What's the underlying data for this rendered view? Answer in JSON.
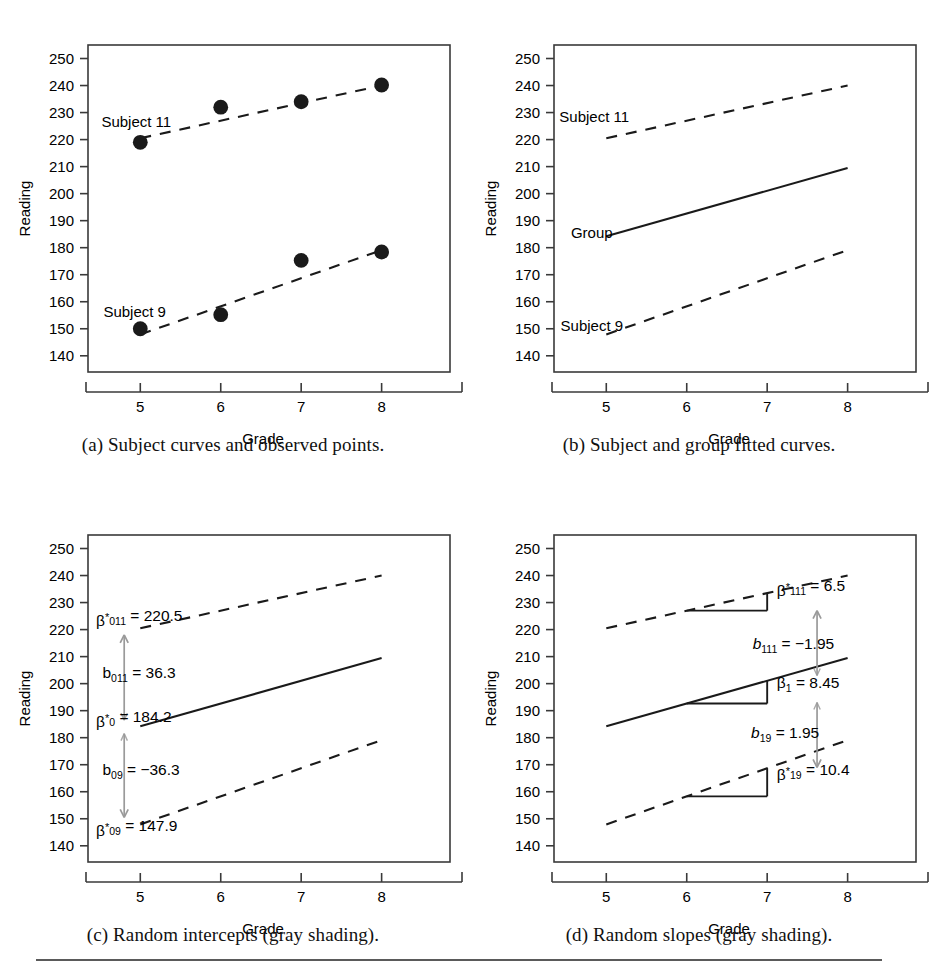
{
  "figure": {
    "axis": {
      "ylabel": "Reading",
      "xlabel": "Grade",
      "yticks": [
        140,
        150,
        160,
        170,
        180,
        190,
        200,
        210,
        220,
        230,
        240,
        250
      ],
      "xticks": [
        5,
        6,
        7,
        8
      ],
      "ylim": [
        134,
        255
      ],
      "xlim": [
        4.35,
        8.85
      ]
    },
    "footer_rule": true
  },
  "panels": [
    {
      "id": "a",
      "caption": "(a) Subject curves and observed points.",
      "labels": [
        {
          "name": "subject-11-label",
          "text": "Subject 11",
          "x": 4.95,
          "y": 224.5,
          "anchor": "middle"
        },
        {
          "name": "subject-9-label",
          "text": "Subject 9",
          "x": 4.93,
          "y": 154.5,
          "anchor": "middle"
        }
      ]
    },
    {
      "id": "b",
      "caption": "(b) Subject and group fitted curves.",
      "labels": [
        {
          "name": "subject-11-label",
          "text": "Subject 11",
          "x": 4.85,
          "y": 226.5,
          "anchor": "middle"
        },
        {
          "name": "group-label",
          "text": "Group",
          "x": 4.82,
          "y": 183.5,
          "anchor": "middle"
        },
        {
          "name": "subject-9-label",
          "text": "Subject 9",
          "x": 4.82,
          "y": 149.0,
          "anchor": "middle"
        }
      ]
    },
    {
      "id": "c",
      "caption": "(c) Random intercepts (gray shading).",
      "annotations": [
        {
          "name": "beta-star-011-annotation",
          "base": "β",
          "star": true,
          "sub": "011",
          "value": "= 220.5",
          "italic": false,
          "x": 4.45,
          "y": 221.5
        },
        {
          "name": "b-011-annotation",
          "base": "b",
          "star": false,
          "sub": "011",
          "value": "= 36.3",
          "italic": false,
          "x": 4.53,
          "y": 202.2
        },
        {
          "name": "beta-star-0-annotation",
          "base": "β",
          "star": true,
          "sub": "0",
          "value": "= 184.2",
          "italic": false,
          "x": 4.45,
          "y": 183.8
        },
        {
          "name": "b-09-annotation",
          "base": "b",
          "star": false,
          "sub": "09",
          "value": "= −36.3",
          "italic": false,
          "x": 4.53,
          "y": 166.2
        },
        {
          "name": "beta-star-09-annotation",
          "base": "β",
          "star": true,
          "sub": "09",
          "value": "= 147.9",
          "italic": false,
          "x": 4.45,
          "y": 143.8
        }
      ],
      "arrows": [
        {
          "name": "intercept-shift-up-arrow",
          "x": 4.8,
          "y0": 186.5,
          "y1": 218.0
        },
        {
          "name": "intercept-shift-down-arrow",
          "x": 4.8,
          "y0": 181.5,
          "y1": 150.5
        }
      ]
    },
    {
      "id": "d",
      "caption": "(d) Random slopes (gray shading).",
      "annotations": [
        {
          "name": "beta-star-111-annotation",
          "base": "β",
          "star": true,
          "sub": "111",
          "value": "= 6.5",
          "italic": false,
          "x": 7.12,
          "y": 232.5
        },
        {
          "name": "b-111-annotation",
          "base": "b",
          "star": false,
          "sub": "111",
          "value": "= −1.95",
          "italic": true,
          "x": 6.82,
          "y": 213.0
        },
        {
          "name": "beta-1-annotation",
          "base": "β",
          "star": false,
          "sub": "1",
          "value": "= 8.45",
          "italic": false,
          "x": 7.12,
          "y": 198.5
        },
        {
          "name": "b-19-annotation",
          "base": "b",
          "star": false,
          "sub": "19",
          "value": "= 1.95",
          "italic": true,
          "x": 6.8,
          "y": 180.0
        },
        {
          "name": "beta-star-19-annotation",
          "base": "β",
          "star": true,
          "sub": "19",
          "value": "= 10.4",
          "italic": false,
          "x": 7.12,
          "y": 164.5
        }
      ],
      "arrows": [
        {
          "name": "slope-shift-upper-arrow",
          "x": 7.62,
          "y0": 203.0,
          "y1": 227.0
        },
        {
          "name": "slope-shift-lower-arrow",
          "x": 7.62,
          "y0": 193.0,
          "y1": 169.0
        }
      ],
      "triangles": [
        {
          "name": "slope-triangle-subject-11",
          "x0": 6.0,
          "x1": 7.0,
          "line": "s11"
        },
        {
          "name": "slope-triangle-group",
          "x0": 6.0,
          "x1": 7.0,
          "line": "group"
        },
        {
          "name": "slope-triangle-subject-9",
          "x0": 6.0,
          "x1": 7.0,
          "line": "s9"
        }
      ]
    }
  ],
  "chart_data": {
    "type": "line",
    "title": "",
    "xlabel": "Grade",
    "ylabel": "Reading",
    "xlim": [
      4.35,
      8.85
    ],
    "ylim": [
      134,
      255
    ],
    "xticks": [
      5,
      6,
      7,
      8
    ],
    "yticks": [
      140,
      150,
      160,
      170,
      180,
      190,
      200,
      210,
      220,
      230,
      240,
      250
    ],
    "grid": false,
    "legend": "inline-labels",
    "x": [
      5,
      6,
      7,
      8
    ],
    "observed": [
      {
        "name": "Subject 11",
        "values": [
          219.0,
          232.0,
          234.0,
          240.2
        ]
      },
      {
        "name": "Subject 9",
        "values": [
          150.0,
          155.2,
          175.3,
          178.4
        ]
      }
    ],
    "fitted": [
      {
        "name": "Subject 11",
        "style": "dashed",
        "x": [
          5,
          8
        ],
        "values": [
          220.5,
          240.0
        ]
      },
      {
        "name": "Group",
        "style": "solid",
        "x": [
          5,
          8
        ],
        "values": [
          184.2,
          209.5
        ]
      },
      {
        "name": "Subject 9",
        "style": "dashed",
        "x": [
          5,
          8
        ],
        "values": [
          147.9,
          179.1
        ]
      }
    ],
    "parameters": {
      "beta_star_011": 220.5,
      "b_011": 36.3,
      "beta_star_0": 184.2,
      "b_09": -36.3,
      "beta_star_09": 147.9,
      "beta_star_111": 6.5,
      "b_111": -1.95,
      "beta_1": 8.45,
      "b_19": 1.95,
      "beta_star_19": 10.4
    }
  },
  "colors": {
    "line": "#1a1a1a",
    "arrow_gray": "#9a9a9a",
    "axis": "#3a3a3a",
    "text": "#000000"
  }
}
